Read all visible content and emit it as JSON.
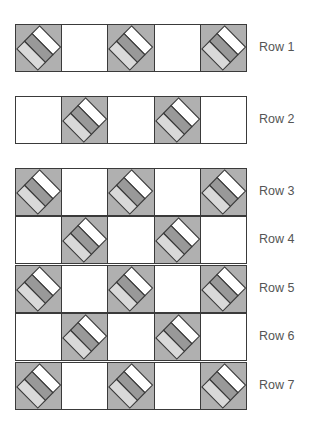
{
  "diagram": {
    "type": "quilt-layout",
    "columns": 5,
    "colors": {
      "block_background": "#b0b0b0",
      "plain_square": "#ffffff",
      "stripe_top": "#ffffff",
      "stripe_middle": "#999999",
      "stripe_bottom": "#d9d9d9",
      "outline": "#3a3a3a",
      "label": "#555555"
    },
    "rows": [
      {
        "label": "Row 1",
        "pattern": [
          "pieced",
          "plain",
          "pieced",
          "plain",
          "pieced"
        ]
      },
      {
        "label": "Row 2",
        "pattern": [
          "plain",
          "pieced",
          "plain",
          "pieced",
          "plain"
        ]
      },
      {
        "label": "Row 3",
        "pattern": [
          "pieced",
          "plain",
          "pieced",
          "plain",
          "pieced"
        ]
      },
      {
        "label": "Row 4",
        "pattern": [
          "plain",
          "pieced",
          "plain",
          "pieced",
          "plain"
        ]
      },
      {
        "label": "Row 5",
        "pattern": [
          "pieced",
          "plain",
          "pieced",
          "plain",
          "pieced"
        ]
      },
      {
        "label": "Row 6",
        "pattern": [
          "plain",
          "pieced",
          "plain",
          "pieced",
          "plain"
        ]
      },
      {
        "label": "Row 7",
        "pattern": [
          "pieced",
          "plain",
          "pieced",
          "plain",
          "pieced"
        ]
      }
    ]
  }
}
